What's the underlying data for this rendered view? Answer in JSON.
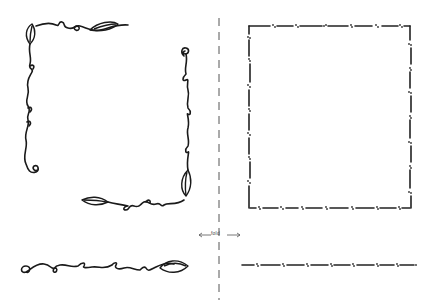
{
  "page": {
    "fold_label": "fold",
    "colors": {
      "ink": "#1a1a1a",
      "guide": "#555555",
      "background": "#ffffff"
    }
  },
  "elements": [
    {
      "id": "vine-corner-top-left",
      "style": "vine with leaves and curls"
    },
    {
      "id": "vine-corner-bottom-right",
      "style": "vine with leaves and curls"
    },
    {
      "id": "vine-horizontal-border",
      "style": "vine with leaf and curl"
    },
    {
      "id": "dotted-dash-square-frame",
      "style": "dash with dot clusters"
    },
    {
      "id": "dotted-dash-horizontal-border",
      "style": "dash with dot clusters"
    },
    {
      "id": "fold-line",
      "style": "vertical dashed guide"
    }
  ]
}
